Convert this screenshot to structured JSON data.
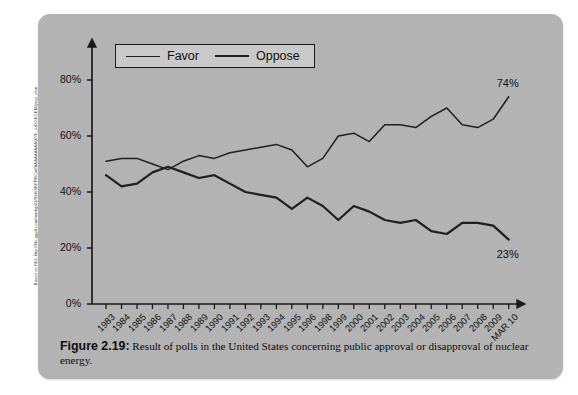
{
  "source_credit": "Based on NEI, http://hfc.ggplt.com/markgt21/SLWSKFPMCwl/AAAAAAAAAQ/Yk_ozDGEGEM/prop_chart%5B4%5D.jpg",
  "figure": {
    "label": "Figure 2.19:",
    "caption": "Result of polls in the United States concerning public approval or disapproval of nuclear energy."
  },
  "legend": {
    "position": "top-left-inside",
    "entries": [
      {
        "label": "Favor",
        "icon": "line-swatch-thin"
      },
      {
        "label": "Oppose",
        "icon": "line-swatch-thick"
      }
    ]
  },
  "colors": {
    "panel": "#b3b3b3",
    "line": "#1f1f1f",
    "legend_bg": "#c9c9c9",
    "axis": "#1a1a1a",
    "page": "#ffffff"
  },
  "endpoint_labels": {
    "favor": "74%",
    "oppose": "23%"
  },
  "chart_data": {
    "type": "line",
    "title": "",
    "subtitle": "",
    "xlabel": "",
    "ylabel": "",
    "ylim": [
      0,
      90
    ],
    "yticks": [
      0,
      20,
      40,
      60,
      80
    ],
    "ytick_labels": [
      "0%",
      "20%",
      "40%",
      "60%",
      "80%"
    ],
    "grid": false,
    "legend_position": "upper left",
    "categories": [
      "1983",
      "1984",
      "1985",
      "1986",
      "1987",
      "1988",
      "1989",
      "1990",
      "1991",
      "1992",
      "1993",
      "1994",
      "1995",
      "1996",
      "1998",
      "1999",
      "2000",
      "2001",
      "2002",
      "2003",
      "2004",
      "2005",
      "2006",
      "2007",
      "2008",
      "2009",
      "MAR 10"
    ],
    "series": [
      {
        "name": "Favor",
        "values": [
          51,
          52,
          52,
          50,
          48,
          51,
          53,
          52,
          54,
          55,
          56,
          57,
          55,
          49,
          52,
          60,
          61,
          58,
          64,
          64,
          63,
          67,
          70,
          64,
          63,
          66,
          74
        ]
      },
      {
        "name": "Oppose",
        "values": [
          46,
          42,
          43,
          47,
          49,
          47,
          45,
          46,
          43,
          40,
          39,
          38,
          34,
          38,
          35,
          30,
          35,
          33,
          30,
          29,
          30,
          26,
          25,
          29,
          29,
          28,
          23
        ]
      }
    ],
    "annotations": [
      {
        "text": "74%",
        "series": "Favor",
        "x": "MAR 10",
        "y": 74
      },
      {
        "text": "23%",
        "series": "Oppose",
        "x": "MAR 10",
        "y": 23
      }
    ]
  }
}
